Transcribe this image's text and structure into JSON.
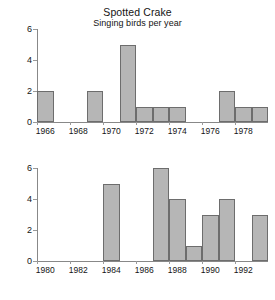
{
  "chart_data": [
    {
      "type": "bar",
      "panel": "top",
      "title": "Spotted Crake",
      "subtitle": "Singing birds per year",
      "xlabel": "",
      "ylabel": "",
      "ylim": [
        0,
        6
      ],
      "yticks": [
        0,
        2,
        4,
        6
      ],
      "xlim": [
        1966,
        1980
      ],
      "xticks": [
        1966,
        1968,
        1970,
        1972,
        1974,
        1976,
        1978
      ],
      "grid": false,
      "legend": "none",
      "bar_fill": "#b6b6b6",
      "bar_edge": "#6d6d6d",
      "categories": [
        1966,
        1967,
        1968,
        1969,
        1970,
        1971,
        1972,
        1973,
        1974,
        1975,
        1976,
        1977,
        1978,
        1979
      ],
      "values": [
        2,
        0,
        0,
        2,
        0,
        5,
        1,
        1,
        1,
        0,
        0,
        2,
        1,
        1
      ]
    },
    {
      "type": "bar",
      "panel": "bottom",
      "title": "",
      "subtitle": "",
      "xlabel": "",
      "ylabel": "",
      "ylim": [
        0,
        6
      ],
      "yticks": [
        0,
        2,
        4,
        6
      ],
      "xlim": [
        1980,
        1994
      ],
      "xticks": [
        1980,
        1982,
        1984,
        1986,
        1988,
        1990,
        1992
      ],
      "grid": false,
      "legend": "none",
      "bar_fill": "#b6b6b6",
      "bar_edge": "#6d6d6d",
      "categories": [
        1980,
        1981,
        1982,
        1983,
        1984,
        1985,
        1986,
        1987,
        1988,
        1989,
        1990,
        1991,
        1992,
        1993
      ],
      "values": [
        0,
        0,
        0,
        0,
        5,
        0,
        0,
        6,
        4,
        1,
        3,
        4,
        0,
        3
      ]
    }
  ]
}
